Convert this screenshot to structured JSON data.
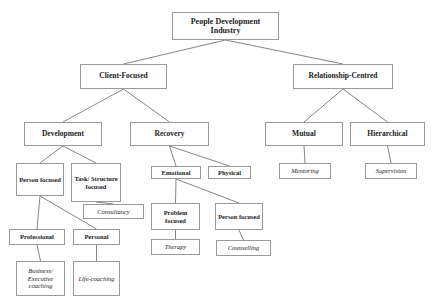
{
  "diagram": {
    "title": "People Development Industry",
    "nodes": [
      {
        "id": "root",
        "label": "People Development Industry",
        "kind": "category"
      },
      {
        "id": "client",
        "label": "Client-Focused",
        "kind": "category"
      },
      {
        "id": "relationship",
        "label": "Relationship-Centred",
        "kind": "category"
      },
      {
        "id": "development",
        "label": "Development",
        "kind": "category"
      },
      {
        "id": "recovery",
        "label": "Recovery",
        "kind": "category"
      },
      {
        "id": "mutual",
        "label": "Mutual",
        "kind": "category"
      },
      {
        "id": "hierarchical",
        "label": "Hierarchical",
        "kind": "category"
      },
      {
        "id": "person_focused_dev",
        "label": "Person focused",
        "kind": "category"
      },
      {
        "id": "task_focused",
        "label": "Task/ Structure focused",
        "kind": "category"
      },
      {
        "id": "emotional",
        "label": "Emotional",
        "kind": "category"
      },
      {
        "id": "physical",
        "label": "Physical",
        "kind": "category"
      },
      {
        "id": "mentoring",
        "label": "Mentoring",
        "kind": "practice"
      },
      {
        "id": "supervision",
        "label": "Supervision",
        "kind": "practice"
      },
      {
        "id": "consultancy",
        "label": "Consultancy",
        "kind": "practice"
      },
      {
        "id": "problem_focused",
        "label": "Problem focused",
        "kind": "category"
      },
      {
        "id": "person_focused_rec",
        "label": "Person focused",
        "kind": "category"
      },
      {
        "id": "professional",
        "label": "Professional",
        "kind": "category"
      },
      {
        "id": "personal",
        "label": "Personal",
        "kind": "category"
      },
      {
        "id": "therapy",
        "label": "Therapy",
        "kind": "practice"
      },
      {
        "id": "counselling",
        "label": "Counselling",
        "kind": "practice"
      },
      {
        "id": "business_coaching",
        "label": "Business/ Executive coaching",
        "kind": "practice"
      },
      {
        "id": "life_coaching",
        "label": "Life-coaching",
        "kind": "practice"
      }
    ],
    "edges": [
      [
        "root",
        "client"
      ],
      [
        "root",
        "relationship"
      ],
      [
        "client",
        "development"
      ],
      [
        "client",
        "recovery"
      ],
      [
        "relationship",
        "mutual"
      ],
      [
        "relationship",
        "hierarchical"
      ],
      [
        "development",
        "person_focused_dev"
      ],
      [
        "development",
        "task_focused"
      ],
      [
        "recovery",
        "emotional"
      ],
      [
        "recovery",
        "physical"
      ],
      [
        "mutual",
        "mentoring"
      ],
      [
        "hierarchical",
        "supervision"
      ],
      [
        "task_focused",
        "consultancy"
      ],
      [
        "emotional",
        "problem_focused"
      ],
      [
        "emotional",
        "person_focused_rec"
      ],
      [
        "person_focused_dev",
        "professional"
      ],
      [
        "person_focused_dev",
        "personal"
      ],
      [
        "problem_focused",
        "therapy"
      ],
      [
        "person_focused_rec",
        "counselling"
      ],
      [
        "professional",
        "business_coaching"
      ],
      [
        "personal",
        "life_coaching"
      ]
    ]
  }
}
